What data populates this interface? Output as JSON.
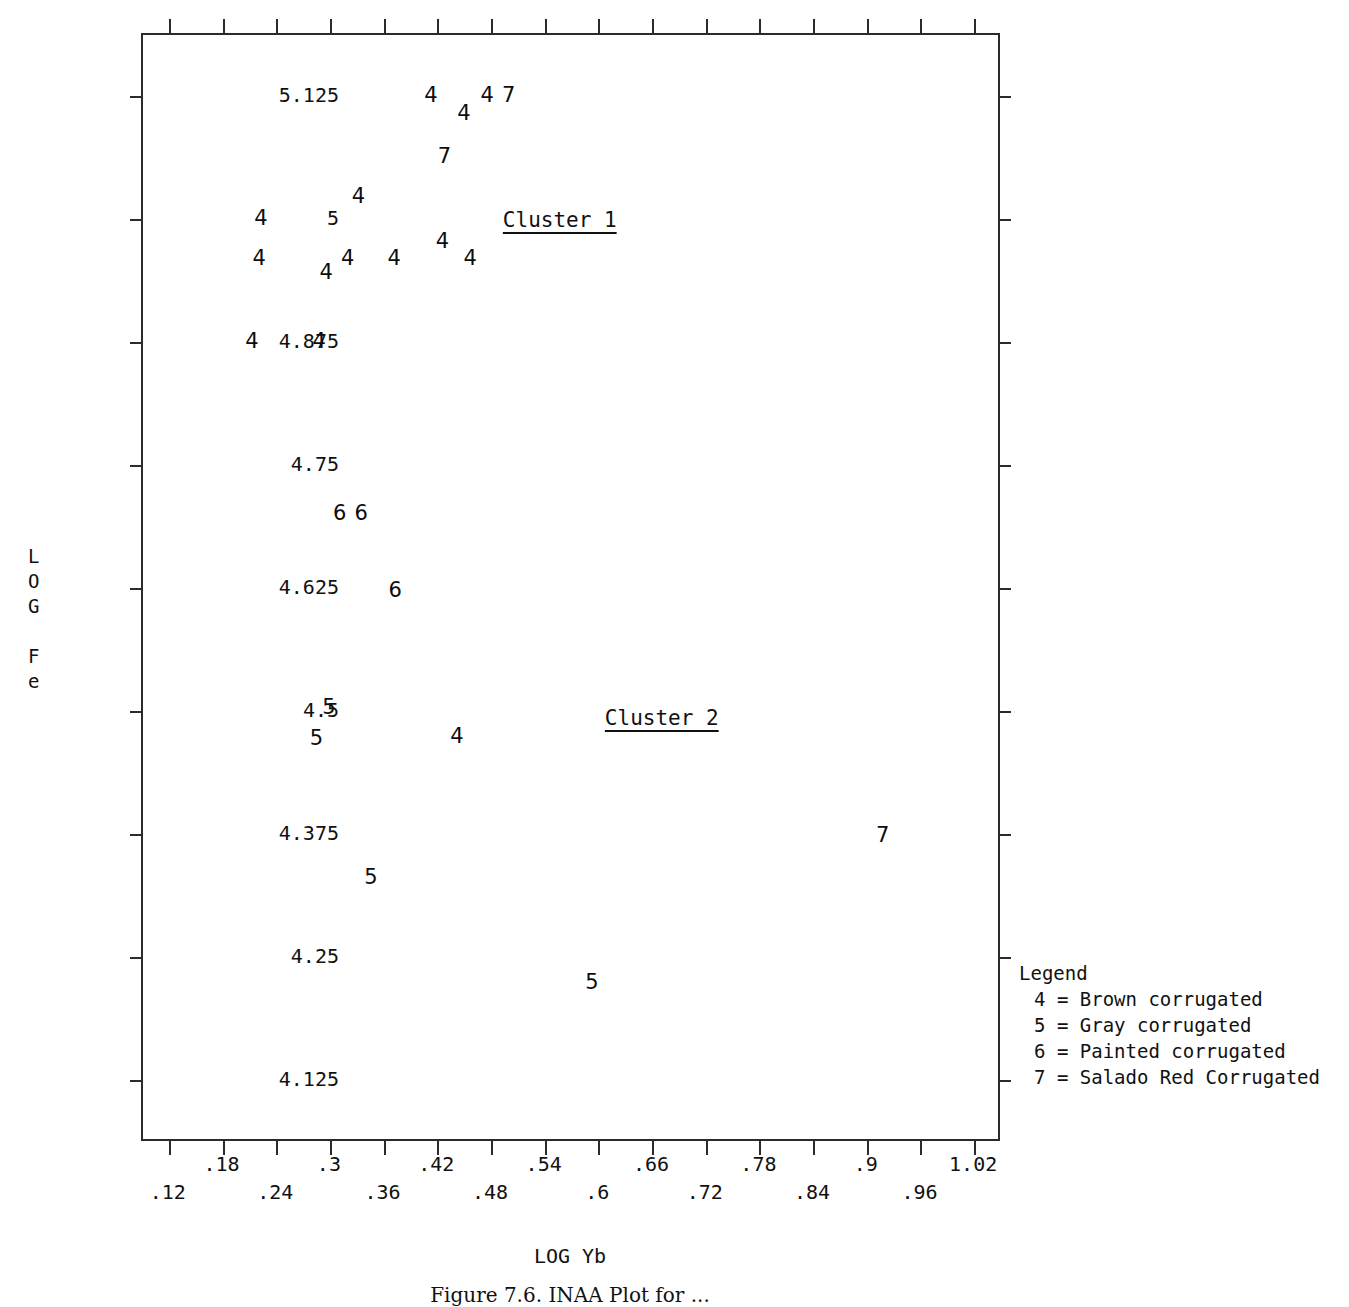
{
  "chart_data": {
    "type": "scatter",
    "title": "",
    "xlabel": "LOG Yb",
    "ylabel": "LOG Fe",
    "ylabel_stacked": [
      "L",
      "O",
      "G",
      "",
      "F",
      "e"
    ],
    "xlim": [
      0.09,
      1.05
    ],
    "ylim": [
      4.0625,
      5.1875
    ],
    "grid": false,
    "legend_position": "outside-right-bottom",
    "xticks": [
      0.12,
      0.18,
      0.24,
      0.3,
      0.36,
      0.42,
      0.48,
      0.54,
      0.6,
      0.66,
      0.72,
      0.78,
      0.84,
      0.9,
      0.96,
      1.02
    ],
    "xticklabels": [
      ".12",
      ".18",
      ".24",
      ".3",
      ".36",
      ".42",
      ".48",
      ".54",
      ".6",
      ".66",
      ".72",
      ".78",
      ".84",
      ".9",
      ".96",
      "1.02"
    ],
    "xticklabels_upper_row": [
      ".18",
      ".3",
      ".42",
      ".54",
      ".66",
      ".78",
      ".9",
      "1.02"
    ],
    "xticklabels_lower_row": [
      ".12",
      ".24",
      ".36",
      ".48",
      ".6",
      ".72",
      ".84",
      ".96"
    ],
    "yticks": [
      4.125,
      4.25,
      4.375,
      4.5,
      4.625,
      4.75,
      4.875,
      5,
      5.125
    ],
    "yticklabels": [
      "4.125",
      "4.25",
      "4.375",
      "4.5",
      "4.625",
      "4.75",
      "4.875",
      "5",
      "5.125"
    ],
    "marker_scheme": "numeric-code",
    "annotations": [
      {
        "text": "Cluster 1",
        "x": 0.558,
        "y": 4.998,
        "underlined": true
      },
      {
        "text": "Cluster 2",
        "x": 0.672,
        "y": 4.492,
        "underlined": true
      }
    ],
    "series": [
      {
        "name": "Brown corrugated",
        "code": "4",
        "points": [
          {
            "x": 0.414,
            "y": 5.125
          },
          {
            "x": 0.477,
            "y": 5.125
          },
          {
            "x": 0.451,
            "y": 5.1065
          },
          {
            "x": 0.333,
            "y": 5.0215
          },
          {
            "x": 0.224,
            "y": 5.0
          },
          {
            "x": 0.427,
            "y": 4.9765
          },
          {
            "x": 0.222,
            "y": 4.959
          },
          {
            "x": 0.321,
            "y": 4.959
          },
          {
            "x": 0.373,
            "y": 4.959
          },
          {
            "x": 0.458,
            "y": 4.959
          },
          {
            "x": 0.297,
            "y": 4.945
          },
          {
            "x": 0.214,
            "y": 4.875
          },
          {
            "x": 0.289,
            "y": 4.875
          },
          {
            "x": 0.443,
            "y": 4.4735
          }
        ]
      },
      {
        "name": "Gray corrugated",
        "code": "5",
        "points": [
          {
            "x": 0.3,
            "y": 4.5035
          },
          {
            "x": 0.286,
            "y": 4.472
          },
          {
            "x": 0.347,
            "y": 4.3305
          },
          {
            "x": 0.594,
            "y": 4.2235
          }
        ]
      },
      {
        "name": "Painted corrugated",
        "code": "6",
        "points": [
          {
            "x": 0.312,
            "y": 4.7
          },
          {
            "x": 0.336,
            "y": 4.7
          },
          {
            "x": 0.374,
            "y": 4.622
          }
        ]
      },
      {
        "name": "Salado Red Corrugated",
        "code": "7",
        "points": [
          {
            "x": 0.501,
            "y": 5.125
          },
          {
            "x": 0.429,
            "y": 5.0625
          },
          {
            "x": 0.919,
            "y": 4.3735
          }
        ]
      }
    ]
  },
  "legend": {
    "title": "Legend",
    "entries": [
      {
        "code": "4",
        "sep": "=",
        "label": "Brown corrugated",
        "text": "4 = Brown corrugated"
      },
      {
        "code": "5",
        "sep": "=",
        "label": "Gray corrugated",
        "text": "5 = Gray corrugated"
      },
      {
        "code": "6",
        "sep": "=",
        "label": "Painted corrugated",
        "text": "6 = Painted corrugated"
      },
      {
        "code": "7",
        "sep": "=",
        "label": "Salado Red Corrugated",
        "text": "7 = Salado Red Corrugated"
      }
    ]
  },
  "axis_titles": {
    "x": "LOG Yb",
    "y_line_1": "L",
    "y_line_2": "O",
    "y_line_3": "G",
    "y_line_4": "",
    "y_line_5": "F",
    "y_line_6": "e"
  },
  "caption": {
    "text": "Figure 7.6. INAA Plot for ..."
  },
  "colors": {
    "axis": "#2b2b2b",
    "text": "#111111",
    "marker": "#0d0d0d",
    "background": "#ffffff"
  }
}
